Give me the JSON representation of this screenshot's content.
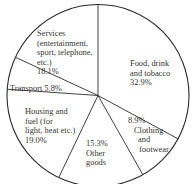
{
  "chart_data": {
    "type": "pie",
    "title": "",
    "start_angle_deg": 0,
    "direction": "clockwise",
    "unit": "%",
    "slices": [
      {
        "name": "Food, drink and tobacco",
        "value": 32.9,
        "label_lines": [
          "Food, drink",
          "and tobacco",
          "32.9%"
        ]
      },
      {
        "name": "Clothing and footwear",
        "value": 8.9,
        "label_lines": [
          "8.9%",
          "Clothing",
          "and",
          "footwear"
        ]
      },
      {
        "name": "Other goods",
        "value": 15.3,
        "label_lines": [
          "15.3%",
          "Other",
          "goods"
        ]
      },
      {
        "name": "Housing and fuel (for light, heat etc.)",
        "value": 19.0,
        "label_lines": [
          "Housing and",
          "fuel (for",
          "light, heat etc.)",
          "19.0%"
        ]
      },
      {
        "name": "Transport",
        "value": 5.8,
        "label_lines": [
          "Transport 5.8%"
        ]
      },
      {
        "name": "Services (entertainment, sport, telephone, etc.)",
        "value": 18.1,
        "label_lines": [
          "Services",
          "(entertainment,",
          "sport, telephone,",
          "etc.)",
          "18.1%"
        ]
      }
    ],
    "categories": [
      "Food, drink and tobacco",
      "Clothing and footwear",
      "Other goods",
      "Housing and fuel (for light, heat etc.)",
      "Transport",
      "Services (entertainment, sport, telephone, etc.)"
    ],
    "values": [
      32.9,
      8.9,
      15.3,
      19.0,
      5.8,
      18.1
    ],
    "legend": "none (labels placed inside slices)",
    "colors": {
      "fill": "#ffffff",
      "stroke": "#2a2a2a"
    }
  }
}
